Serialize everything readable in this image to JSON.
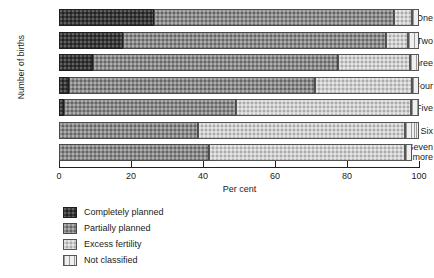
{
  "chart_data": {
    "type": "bar",
    "orientation": "horizontal",
    "stacked": true,
    "title": "",
    "xlabel": "Per cent",
    "ylabel": "Number of births",
    "xlim": [
      0,
      100
    ],
    "xticks": [
      0,
      20,
      40,
      60,
      80,
      100
    ],
    "xticklabels": [
      "0",
      "20",
      "40",
      "60",
      "80",
      "100"
    ],
    "grid": false,
    "legend_position": "below-left",
    "categories": [
      "One",
      "Two",
      "Three",
      "Four",
      "Five",
      "Six",
      "Seven or more"
    ],
    "series": [
      {
        "name": "Completely planned",
        "color": "#3a3a3a",
        "values": [
          26.5,
          17.8,
          9.5,
          2.8,
          1.5,
          0.0,
          0.0
        ]
      },
      {
        "name": "Partially planned",
        "color": "#8c8c8c",
        "values": [
          66.5,
          73.0,
          68.0,
          68.3,
          47.7,
          38.6,
          41.7
        ]
      },
      {
        "name": "Excess fertility",
        "color": "#cfcfcf",
        "values": [
          5.0,
          6.2,
          20.0,
          26.9,
          48.6,
          57.4,
          54.3
        ]
      },
      {
        "name": "Not classified",
        "color": "#e6e6e6",
        "values": [
          2.0,
          3.0,
          2.5,
          2.0,
          2.2,
          4.0,
          2.0
        ]
      }
    ]
  },
  "axes": {
    "y_title": "Number of births",
    "x_title": "Per cent",
    "y_labels": [
      {
        "line1": "One",
        "line2": ""
      },
      {
        "line1": "Two",
        "line2": ""
      },
      {
        "line1": "Three",
        "line2": ""
      },
      {
        "line1": "Four",
        "line2": ""
      },
      {
        "line1": "Five",
        "line2": ""
      },
      {
        "line1": "Six",
        "line2": ""
      },
      {
        "line1": "Seven",
        "line2": "or more"
      }
    ]
  },
  "legend": {
    "items": [
      {
        "label": "Completely planned",
        "swatch": "completely"
      },
      {
        "label": "Partially planned",
        "swatch": "partially"
      },
      {
        "label": "Excess fertility",
        "swatch": "excess"
      },
      {
        "label": "Not classified",
        "swatch": "notclass"
      }
    ]
  }
}
